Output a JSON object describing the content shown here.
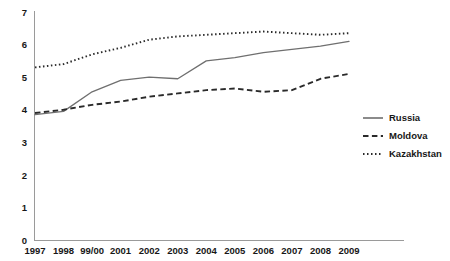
{
  "chart_data": {
    "type": "line",
    "title": "",
    "subtitle": "",
    "xlabel": "",
    "ylabel": "",
    "grid": false,
    "legend_position": "right",
    "categories": [
      "1997",
      "1998",
      "99/00",
      "2001",
      "2002",
      "2003",
      "2004",
      "2005",
      "2006",
      "2007",
      "2008",
      "2009"
    ],
    "x_tick_labels": [
      "1997",
      "1998",
      "99/00",
      "2001",
      "2002",
      "2003",
      "2004",
      "2005",
      "2006",
      "2007",
      "2008",
      "2009"
    ],
    "y_tick_labels": [
      "0",
      "1",
      "2",
      "3",
      "4",
      "5",
      "6",
      "7"
    ],
    "y_ticks": [
      0,
      1,
      2,
      3,
      4,
      5,
      6,
      7
    ],
    "ylim": [
      0,
      7
    ],
    "series": [
      {
        "name": "Russia",
        "style": "solid",
        "color": "#6f6f6f",
        "values": [
          3.85,
          3.95,
          4.55,
          4.9,
          5.0,
          4.95,
          5.5,
          5.6,
          5.75,
          5.85,
          5.95,
          6.1
        ]
      },
      {
        "name": "Moldova",
        "style": "dashed",
        "color": "#2a2a2a",
        "values": [
          3.9,
          4.0,
          4.15,
          4.25,
          4.4,
          4.5,
          4.6,
          4.65,
          4.55,
          4.6,
          4.95,
          5.1
        ]
      },
      {
        "name": "Kazakhstan",
        "style": "dotted",
        "color": "#2a2a2a",
        "values": [
          5.3,
          5.4,
          5.7,
          5.9,
          6.15,
          6.25,
          6.3,
          6.35,
          6.4,
          6.35,
          6.3,
          6.35
        ]
      }
    ]
  },
  "legend": {
    "items": [
      {
        "label": "Russia"
      },
      {
        "label": "Moldova"
      },
      {
        "label": "Kazakhstan"
      }
    ]
  },
  "axes": {
    "y_labels": [
      "7",
      "6",
      "5",
      "4",
      "3",
      "2",
      "1",
      "0"
    ],
    "x_labels": [
      "1997",
      "1998",
      "99/00",
      "2001",
      "2002",
      "2003",
      "2004",
      "2005",
      "2006",
      "2007",
      "2008",
      "2009"
    ]
  }
}
